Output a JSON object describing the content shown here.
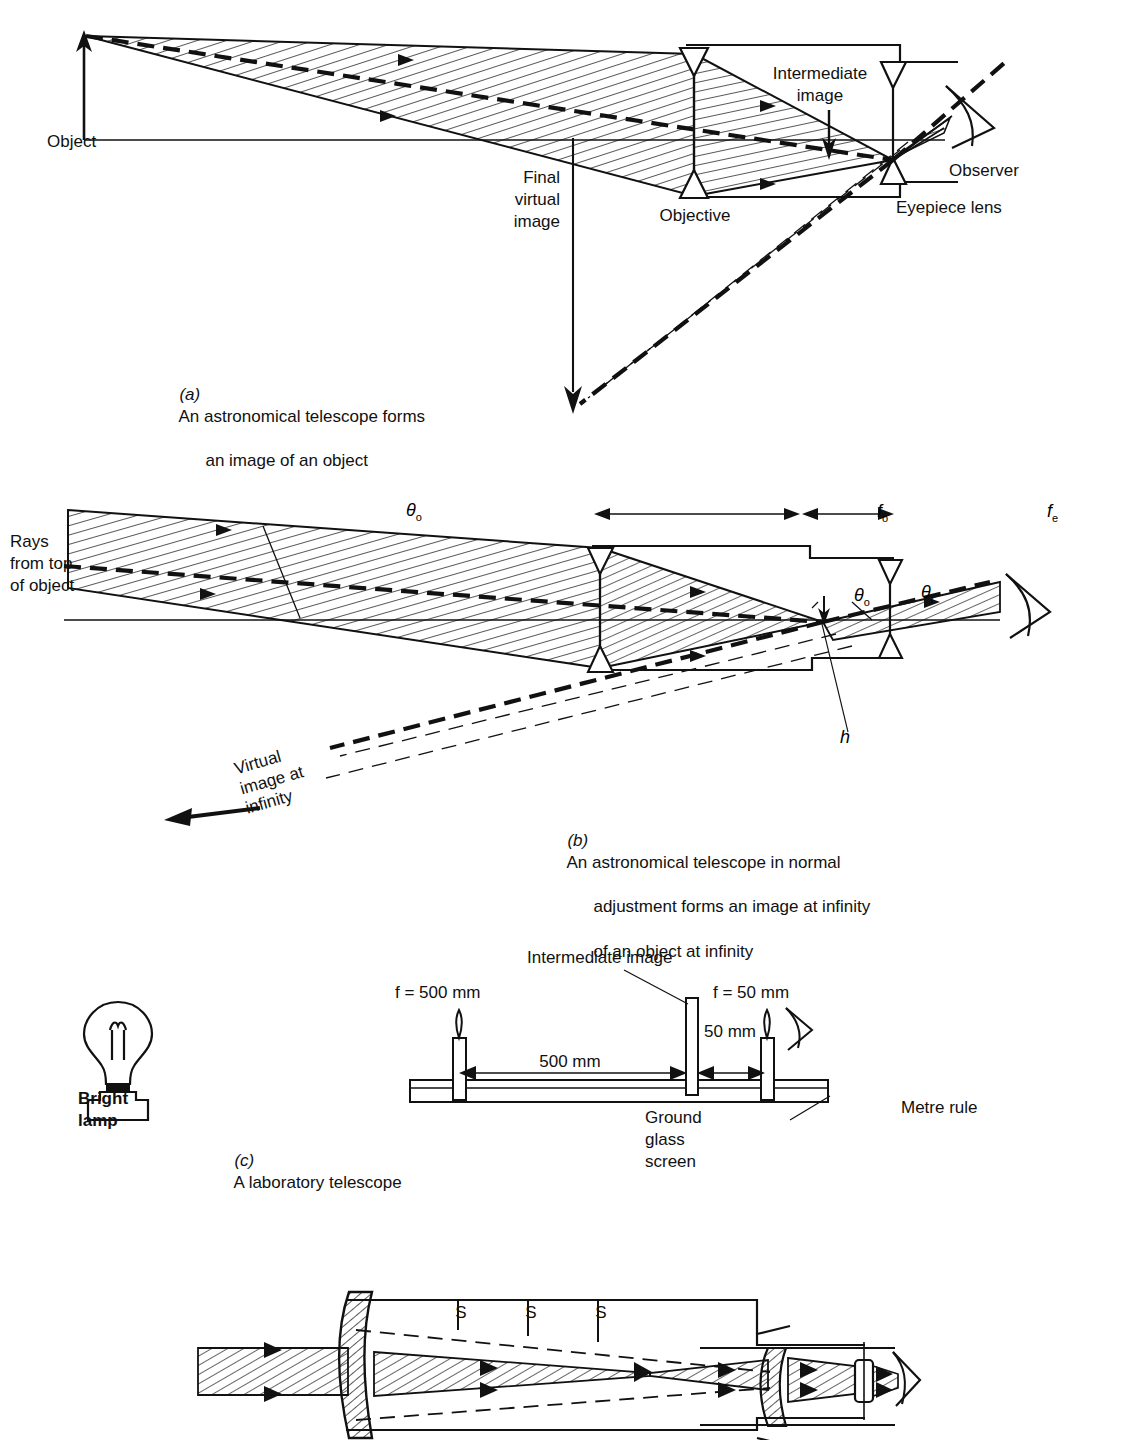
{
  "figure": {
    "ink_color": "#111111",
    "background": "#ffffff"
  },
  "panels": [
    {
      "id": "a",
      "caption_marker": "(a)",
      "caption_line1": "An astronomical telescope forms",
      "caption_line2": "an image of an object",
      "labels": {
        "object": "Object",
        "objective": "Objective",
        "intermediate_image_l1": "Intermediate",
        "intermediate_image_l2": "image",
        "eyepiece": "Eyepiece lens",
        "observer": "Observer",
        "final_virtual_l1": "Final",
        "final_virtual_l2": "virtual",
        "final_virtual_l3": "image"
      }
    },
    {
      "id": "b",
      "caption_marker": "(b)",
      "caption_line1": "An astronomical telescope in normal",
      "caption_line2": "adjustment forms an image at infinity",
      "caption_line3": "of an object at infinity",
      "labels": {
        "rays_l1": "Rays",
        "rays_l2": "from top",
        "rays_l3": "of object",
        "theta_o_left": "θo",
        "theta_o_right": "θo",
        "theta_i": "θi",
        "h": "h",
        "f_o": "fo",
        "f_e": "fe",
        "virtual_l1": "Virtual",
        "virtual_l2": "image at",
        "virtual_l3": "infinity"
      }
    },
    {
      "id": "c",
      "caption_marker": "(c)",
      "caption_line1": "A laboratory telescope",
      "labels": {
        "bright_l1": "Bright",
        "bright_l2": "lamp",
        "f_objective": "f = 500 mm",
        "f_eyepiece": "f = 50 mm",
        "intermediate_image": "Intermediate image",
        "dim_500": "500 mm",
        "dim_50": "50 mm",
        "ground_l1": "Ground",
        "ground_l2": "glass",
        "ground_l3": "screen",
        "metre_rule": "Metre rule"
      }
    },
    {
      "id": "d",
      "labels": {
        "stop1": "S",
        "stop2": "S",
        "stop3": "S"
      }
    }
  ]
}
